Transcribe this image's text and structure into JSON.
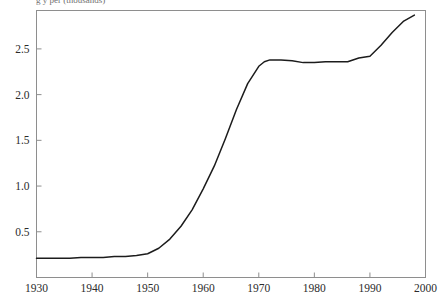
{
  "figure": {
    "title_fragment": "g    y           per            (thousands)",
    "background_color": "#ffffff",
    "frame_color": "#8e8e8e",
    "line_color": "#1c1c1c"
  },
  "chart_data": {
    "type": "line",
    "title": "g y per (thousands)",
    "xlabel": "",
    "ylabel": "",
    "xlim": [
      1930,
      2000
    ],
    "ylim": [
      0.0,
      2.92
    ],
    "xticks": [
      1930,
      1940,
      1950,
      1960,
      1970,
      1980,
      1990,
      2000
    ],
    "xtick_labels": [
      "1930",
      "1940",
      "1950",
      "1960",
      "1970",
      "1980",
      "1990",
      "2000"
    ],
    "yticks": [
      0.5,
      1.0,
      1.5,
      2.0,
      2.5
    ],
    "ytick_labels": [
      "0.5",
      "1.0",
      "1.5",
      "2.0",
      "2.5"
    ],
    "grid": false,
    "legend": false,
    "series": [
      {
        "name": "value",
        "color": "#1c1c1c",
        "x": [
          1930,
          1932,
          1934,
          1936,
          1938,
          1940,
          1942,
          1944,
          1946,
          1948,
          1950,
          1952,
          1954,
          1956,
          1958,
          1960,
          1962,
          1964,
          1966,
          1968,
          1970,
          1971,
          1972,
          1974,
          1976,
          1978,
          1980,
          1982,
          1984,
          1986,
          1988,
          1990,
          1992,
          1994,
          1996,
          1998
        ],
        "y": [
          0.21,
          0.21,
          0.21,
          0.21,
          0.22,
          0.22,
          0.22,
          0.23,
          0.23,
          0.24,
          0.26,
          0.32,
          0.42,
          0.56,
          0.74,
          0.97,
          1.22,
          1.52,
          1.84,
          2.12,
          2.31,
          2.36,
          2.38,
          2.38,
          2.37,
          2.35,
          2.35,
          2.36,
          2.36,
          2.36,
          2.4,
          2.42,
          2.54,
          2.68,
          2.8,
          2.87
        ]
      }
    ]
  },
  "axes": {
    "y_axis_name": "y-axis",
    "x_axis_name": "x-axis"
  }
}
